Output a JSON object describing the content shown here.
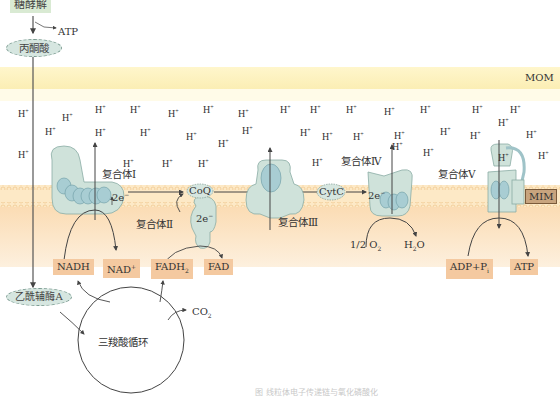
{
  "diagram": {
    "type": "biochemical pathway diagram",
    "regions": {
      "outer_membrane_label": "MOM",
      "inner_membrane_label": "MIM"
    },
    "top_pathway": {
      "glycolysis": "糖酵解",
      "atp_out": "ATP",
      "pyruvate": "丙酮酸",
      "acetyl_coa": "乙酰辅酶A",
      "tca_cycle": "三羧酸循环",
      "co2": "CO",
      "co2_sub": "2"
    },
    "complexes": {
      "c1": "复合体Ⅰ",
      "c2": "复合体Ⅱ",
      "c3": "复合体Ⅲ",
      "c4": "复合体Ⅳ",
      "c5": "复合体Ⅴ"
    },
    "carriers": {
      "coq": "CoQ",
      "cytc": "CytC",
      "electrons": "2e",
      "electrons_sup": "−"
    },
    "substrates": {
      "nadh": "NADH",
      "nad": "NAD",
      "nad_sup": "+",
      "fadh2": "FADH",
      "fadh2_sub": "2",
      "fad": "FAD",
      "o2": "1/2 O",
      "o2_sub": "2",
      "h2o_h": "H",
      "h2o_sub": "2",
      "h2o_o": "O",
      "adp": "ADP+P",
      "adp_sub": "i",
      "atp": "ATP"
    },
    "proton": {
      "symbol": "H",
      "charge": "+"
    },
    "caption": "图  线粒体电子传递链与氧化磷酸化"
  },
  "colors": {
    "membrane_band": "#fbf3cf",
    "matrix": "#fbe4c4",
    "protein_fill": "#cfe2da",
    "protein_dark": "#9fc3c8",
    "label_orange": "#f4c9a0",
    "label_green": "#d9ead3",
    "mim_box": "#c8a47e"
  },
  "proton_positions": [
    [
      18,
      108
    ],
    [
      62,
      112
    ],
    [
      95,
      104
    ],
    [
      130,
      104
    ],
    [
      168,
      108
    ],
    [
      203,
      104
    ],
    [
      238,
      108
    ],
    [
      45,
      126
    ],
    [
      95,
      127
    ],
    [
      140,
      127
    ],
    [
      186,
      131
    ],
    [
      218,
      138
    ],
    [
      242,
      125
    ],
    [
      280,
      104
    ],
    [
      310,
      104
    ],
    [
      346,
      104
    ],
    [
      384,
      106
    ],
    [
      420,
      104
    ],
    [
      472,
      104
    ],
    [
      510,
      104
    ],
    [
      300,
      127
    ],
    [
      322,
      131
    ],
    [
      353,
      131
    ],
    [
      394,
      130
    ],
    [
      440,
      126
    ],
    [
      470,
      130
    ],
    [
      498,
      117
    ],
    [
      526,
      129
    ],
    [
      392,
      141
    ],
    [
      423,
      147
    ],
    [
      18,
      149
    ],
    [
      123,
      158
    ],
    [
      162,
      158
    ],
    [
      198,
      158
    ],
    [
      312,
      157
    ],
    [
      498,
      152
    ],
    [
      538,
      150
    ]
  ]
}
